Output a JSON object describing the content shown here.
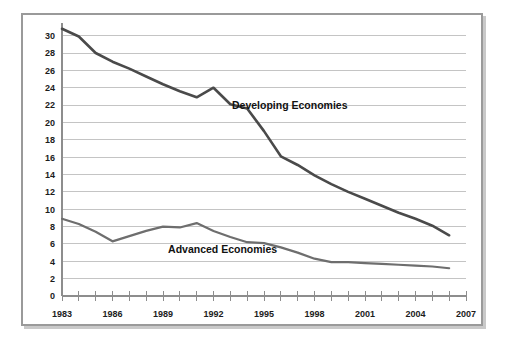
{
  "figure": {
    "background_color": "#ffffff",
    "frame_border_color": "#9a9a9a",
    "shadow_color": "#c9c9c9"
  },
  "chart_data": {
    "type": "line",
    "title": "",
    "subtitle": "",
    "xlabel": "",
    "ylabel": "",
    "xlim": [
      1983,
      2007
    ],
    "ylim": [
      0,
      31
    ],
    "grid": true,
    "grid_axis": "y",
    "legend_position": "inline-annotation",
    "x_tick_labels": [
      "1983",
      "1986",
      "1989",
      "1992",
      "1995",
      "1998",
      "2001",
      "2004",
      "2007"
    ],
    "x_tick_values": [
      1983,
      1986,
      1989,
      1992,
      1995,
      1998,
      2001,
      2004,
      2007
    ],
    "x_minor_tick_values": [
      1984,
      1985,
      1987,
      1988,
      1990,
      1991,
      1993,
      1994,
      1996,
      1997,
      1999,
      2000,
      2002,
      2003,
      2005,
      2006
    ],
    "y_tick_labels": [
      "0",
      "2",
      "4",
      "6",
      "8",
      "10",
      "12",
      "14",
      "16",
      "18",
      "20",
      "22",
      "24",
      "26",
      "28",
      "30"
    ],
    "y_tick_values": [
      0,
      2,
      4,
      6,
      8,
      10,
      12,
      14,
      16,
      18,
      20,
      22,
      24,
      26,
      28,
      30
    ],
    "x": [
      1983,
      1984,
      1985,
      1986,
      1987,
      1988,
      1989,
      1990,
      1991,
      1992,
      1993,
      1994,
      1995,
      1996,
      1997,
      1998,
      1999,
      2000,
      2001,
      2002,
      2003,
      2004,
      2005,
      2006
    ],
    "series": [
      {
        "name": "Developing Economies",
        "color": "#4a4a4a",
        "line_width": 2.6,
        "label_x": 1993.1,
        "label_y": 21.6,
        "values": [
          30.8,
          29.9,
          28.0,
          27.0,
          26.2,
          25.3,
          24.4,
          23.6,
          22.9,
          24.0,
          22.1,
          21.6,
          19.0,
          16.1,
          15.1,
          13.9,
          12.9,
          12.0,
          11.2,
          10.4,
          9.6,
          8.9,
          8.1,
          7.0
        ],
        "label": "Developing Economies"
      },
      {
        "name": "Advanced Economies",
        "color": "#6e6e6e",
        "line_width": 2.2,
        "label_x": 1989.3,
        "label_y": 4.9,
        "values": [
          8.9,
          8.3,
          7.4,
          6.3,
          6.9,
          7.5,
          8.0,
          7.9,
          8.4,
          7.5,
          6.8,
          6.2,
          6.1,
          5.6,
          5.0,
          4.3,
          3.9,
          3.9,
          3.8,
          3.7,
          3.6,
          3.5,
          3.4,
          3.2
        ],
        "label": "Advanced Economies"
      }
    ]
  }
}
